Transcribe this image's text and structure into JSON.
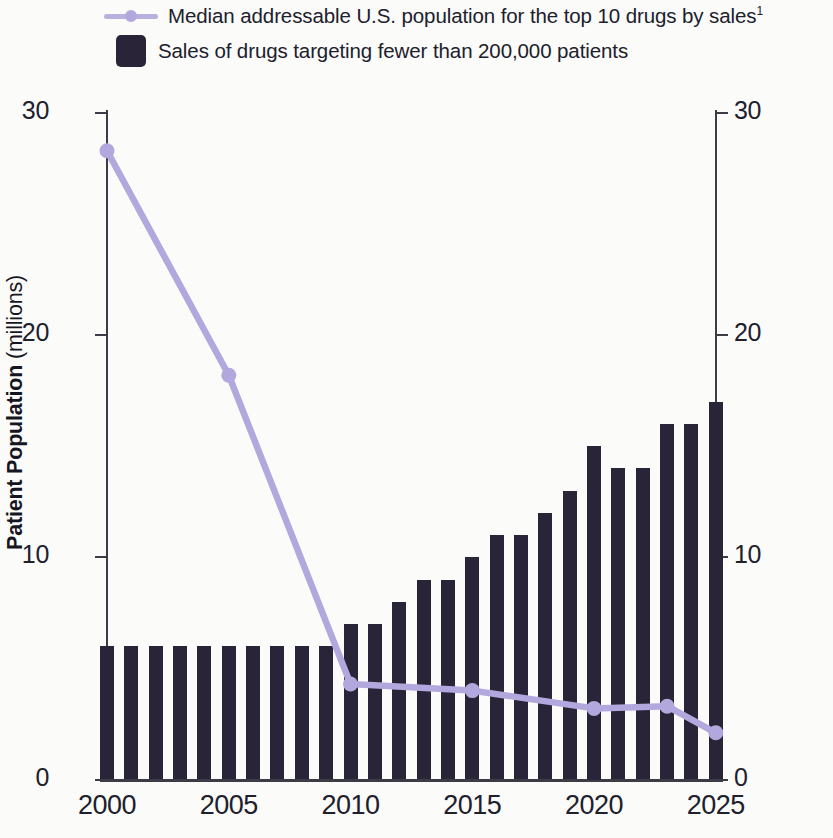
{
  "legend": {
    "line_entry": {
      "label": "Median addressable U.S. population for the top 10 drugs by sales",
      "footnote_marker": "1",
      "color": "#b3a8dd",
      "marker": "line-with-circle-marker"
    },
    "bar_entry": {
      "label": "Sales of drugs targeting fewer than 200,000 patients",
      "color": "#2a2438",
      "marker": "filled-rounded-square"
    }
  },
  "axes": {
    "left": {
      "title_main": "Patient Population",
      "title_unit": "(millions)",
      "ticks": [
        "0",
        "10",
        "20",
        "30"
      ],
      "min": 0,
      "max": 30
    },
    "right": {
      "title_main": "Sales/Worldwide Prescription Spending",
      "title_unit": "(%)",
      "ticks": [
        "0",
        "10",
        "20",
        "30"
      ],
      "min": 0,
      "max": 30
    },
    "bottom": {
      "ticks": [
        "2000",
        "2005",
        "2010",
        "2015",
        "2020",
        "2025"
      ]
    }
  },
  "chart_data": {
    "type": "bar",
    "title": "",
    "subtitle": "",
    "xlabel": "",
    "ylabel": "Patient Population (millions)",
    "y2label": "Sales/Worldwide Prescription Spending (%)",
    "ylim": [
      0,
      30
    ],
    "y2lim": [
      0,
      30
    ],
    "grid": false,
    "legend_position": "top-left",
    "x": [
      2000,
      2001,
      2002,
      2003,
      2004,
      2005,
      2006,
      2007,
      2008,
      2009,
      2010,
      2011,
      2012,
      2013,
      2014,
      2015,
      2016,
      2017,
      2018,
      2019,
      2020,
      2021,
      2022,
      2023,
      2024,
      2025
    ],
    "categories": [
      "2000",
      "2001",
      "2002",
      "2003",
      "2004",
      "2005",
      "2006",
      "2007",
      "2008",
      "2009",
      "2010",
      "2011",
      "2012",
      "2013",
      "2014",
      "2015",
      "2016",
      "2017",
      "2018",
      "2019",
      "2020",
      "2021",
      "2022",
      "2023",
      "2024",
      "2025"
    ],
    "series": [
      {
        "name": "Sales of drugs targeting fewer than 200,000 patients",
        "type": "bar",
        "axis": "right",
        "unit": "%",
        "color": "#2a2438",
        "values": [
          6,
          6,
          6,
          6,
          6,
          6,
          6,
          6,
          6,
          6,
          7,
          7,
          8,
          9,
          9,
          10,
          11,
          11,
          12,
          13,
          15,
          14,
          14,
          16,
          16,
          17
        ]
      },
      {
        "name": "Median addressable U.S. population for the top 10 drugs by sales",
        "type": "line",
        "axis": "left",
        "unit": "millions",
        "color": "#b3a8dd",
        "marker_x": [
          2000,
          2005,
          2010,
          2015,
          2020,
          2023,
          2025
        ],
        "marker_values": [
          28.3,
          18.2,
          4.3,
          4.0,
          3.2,
          3.3,
          2.1
        ],
        "x": [
          2000,
          2005,
          2010,
          2015,
          2020,
          2023,
          2025
        ],
        "values": [
          28.3,
          18.2,
          4.3,
          4.0,
          3.2,
          3.3,
          2.1
        ]
      }
    ]
  }
}
